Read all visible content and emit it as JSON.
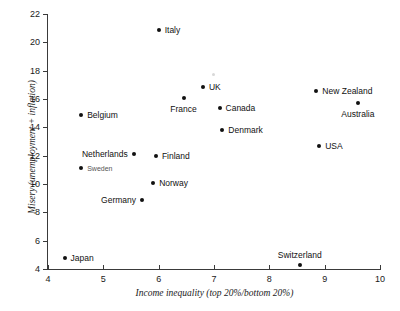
{
  "chart_data": {
    "type": "scatter",
    "title": "",
    "xlabel": "Income inequality (top 20%/bottom 20%)",
    "ylabel": "Misery (unemployment + inflation)",
    "xlim": [
      4,
      10
    ],
    "ylim": [
      4,
      22
    ],
    "xticks": [
      4,
      5,
      6,
      7,
      8,
      9,
      10
    ],
    "yticks": [
      4,
      6,
      8,
      10,
      12,
      14,
      16,
      18,
      20,
      22
    ],
    "grid": false,
    "legend": "none",
    "marker_color": "#111111",
    "points": [
      {
        "label": "Japan",
        "x": 4.3,
        "y": 4.8,
        "label_pos": "right"
      },
      {
        "label": "Belgium",
        "x": 4.6,
        "y": 14.9,
        "label_pos": "right"
      },
      {
        "label": "Sweden",
        "x": 4.6,
        "y": 11.1,
        "label_pos": "right",
        "style": "small"
      },
      {
        "label": "Netherlands",
        "x": 5.55,
        "y": 12.1,
        "label_pos": "left"
      },
      {
        "label": "Germany",
        "x": 5.7,
        "y": 8.9,
        "label_pos": "left"
      },
      {
        "label": "Norway",
        "x": 5.9,
        "y": 10.05,
        "label_pos": "right"
      },
      {
        "label": "Finland",
        "x": 5.95,
        "y": 11.95,
        "label_pos": "right"
      },
      {
        "label": "Italy",
        "x": 6.0,
        "y": 20.85,
        "label_pos": "right"
      },
      {
        "label": "France",
        "x": 6.45,
        "y": 16.05,
        "label_pos": "below"
      },
      {
        "label": "UK",
        "x": 6.8,
        "y": 16.85,
        "label_pos": "right"
      },
      {
        "label": "Canada",
        "x": 7.1,
        "y": 15.35,
        "label_pos": "right"
      },
      {
        "label": "Denmark",
        "x": 7.15,
        "y": 13.8,
        "label_pos": "right"
      },
      {
        "label": "Switzerland",
        "x": 8.55,
        "y": 4.3,
        "label_pos": "above"
      },
      {
        "label": "New Zealand",
        "x": 8.85,
        "y": 16.6,
        "label_pos": "right"
      },
      {
        "label": "USA",
        "x": 8.9,
        "y": 12.7,
        "label_pos": "right"
      },
      {
        "label": "Australia",
        "x": 9.6,
        "y": 15.75,
        "label_pos": "below"
      }
    ]
  }
}
